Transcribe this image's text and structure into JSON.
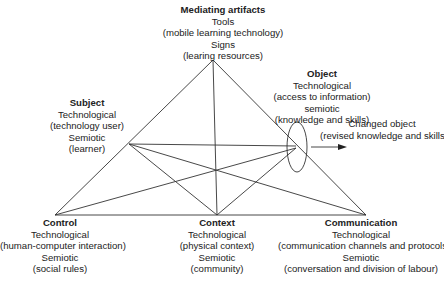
{
  "diagram": {
    "type": "activity-theory-triangle",
    "line_color": "#333333",
    "nodes": {
      "mediating": {
        "title": "Mediating artifacts",
        "lines": [
          "Tools",
          "(mobile learning technology)",
          "Signs",
          "(learing resources)"
        ]
      },
      "subject": {
        "title": "Subject",
        "lines": [
          "Technological",
          "(technology user)",
          "Semiotic",
          "(learner)"
        ]
      },
      "object": {
        "title": "Object",
        "lines": [
          "Technological",
          "(access to information)",
          "semiotic",
          "(knowledge and skills)"
        ]
      },
      "changed": {
        "lines": [
          "Changed object",
          "(revised knowledge and skills)"
        ]
      },
      "control": {
        "title": "Control",
        "lines": [
          "Technological",
          "(human-computer interaction)",
          "Semiotic",
          "(social rules)"
        ]
      },
      "context": {
        "title": "Context",
        "lines": [
          "Technological",
          "(physical context)",
          "Semiotic",
          "(community)"
        ]
      },
      "communication": {
        "title": "Communication",
        "lines": [
          "Technological",
          "(communication channels and protocols)",
          "Semiotic",
          "(conversation and division of labour)"
        ]
      }
    }
  }
}
